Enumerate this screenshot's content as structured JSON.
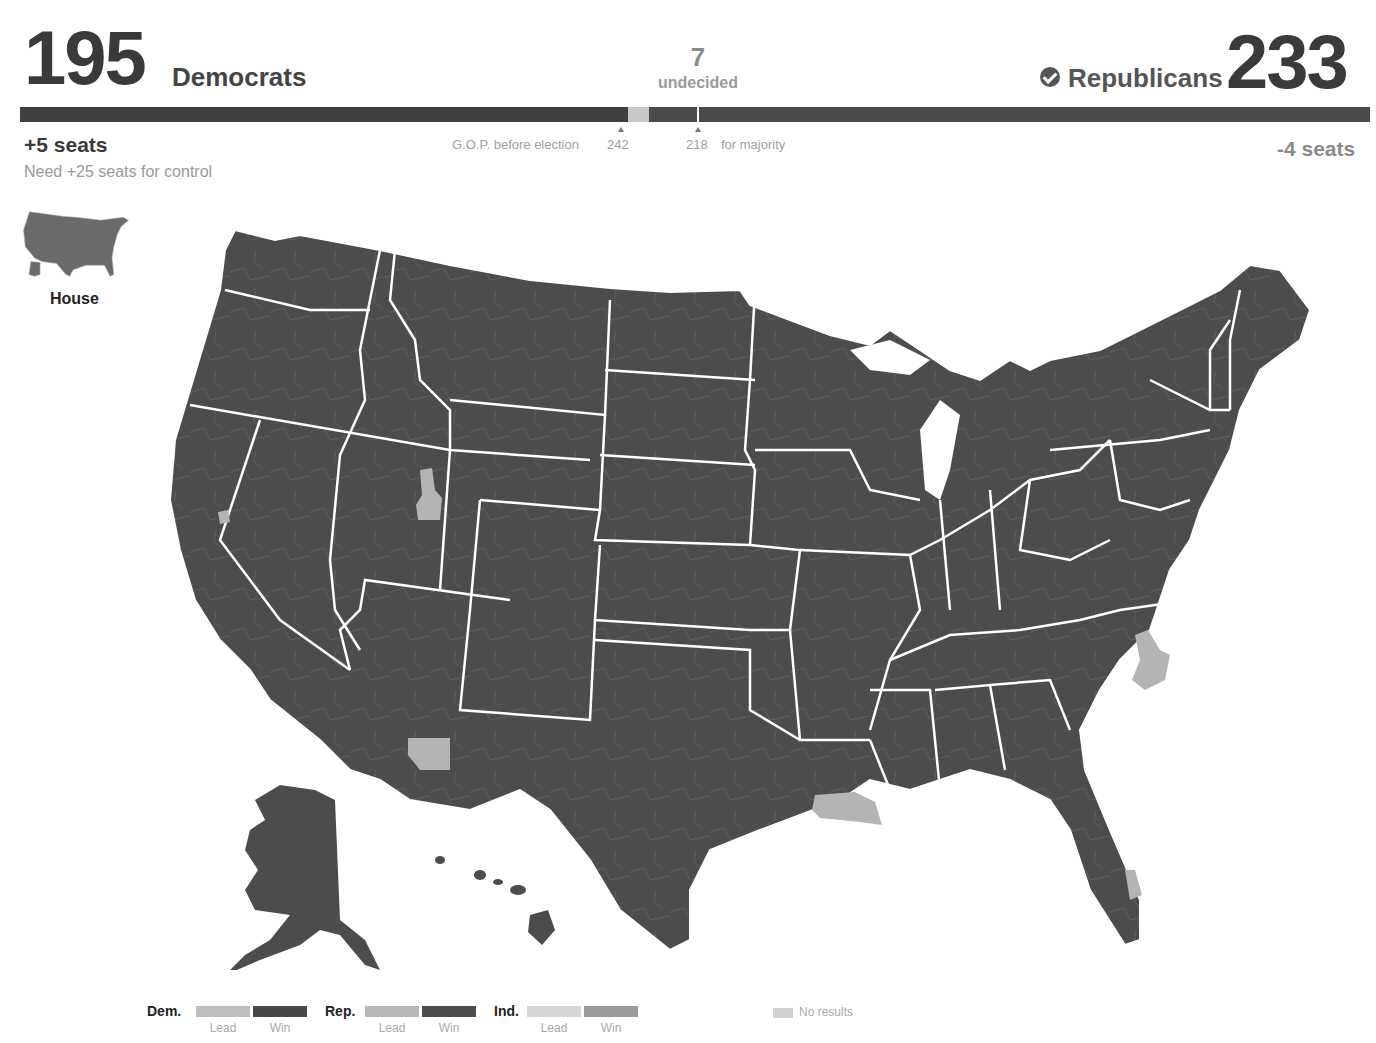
{
  "header": {
    "democrats": {
      "count": "195",
      "label": "Democrats",
      "change": "+5 seats",
      "note": "Need +25 seats for control"
    },
    "undecided": {
      "count": "7",
      "label": "undecided"
    },
    "republicans": {
      "count": "233",
      "label": "Republicans",
      "change": "-4 seats",
      "winner_icon": "check-circle-icon"
    },
    "bar": {
      "dem_seats": 195,
      "undecided_seats": 7,
      "rep_seats": 233,
      "colors": {
        "dem": "#3f3f3f",
        "undecided": "#c8c8c8",
        "rep": "#4b4b4b"
      }
    },
    "markers": {
      "gop_before_label": "G.O.P. before election",
      "gop_before_value": "242",
      "majority_value": "218",
      "majority_label": "for majority"
    }
  },
  "thumbnail": {
    "label": "House",
    "icon": "us-map-thumbnail-icon"
  },
  "map": {
    "chamber": "House",
    "colors": {
      "win_fill": "#4c4c4c",
      "no_results_fill": "#b4b4b4",
      "state_border": "#ffffff",
      "district_border": "#6a6a6a"
    },
    "light_regions": [
      "Utah (Salt Lake area)",
      "Northern California",
      "Southern Arizona",
      "North Carolina (central)",
      "Louisiana (southwest coast)",
      "Florida (southeast coast)"
    ]
  },
  "legend": {
    "groups": [
      {
        "party": "Dem.",
        "lead_label": "Lead",
        "win_label": "Win",
        "lead_color": "#bdbdbd",
        "win_color": "#474747"
      },
      {
        "party": "Rep.",
        "lead_label": "Lead",
        "win_label": "Win",
        "lead_color": "#b8b8b8",
        "win_color": "#4d4d4d"
      },
      {
        "party": "Ind.",
        "lead_label": "Lead",
        "win_label": "Win",
        "lead_color": "#d6d6d6",
        "win_color": "#9a9a9a"
      }
    ],
    "no_results": {
      "label": "No results",
      "color": "#d0d0d0"
    }
  }
}
